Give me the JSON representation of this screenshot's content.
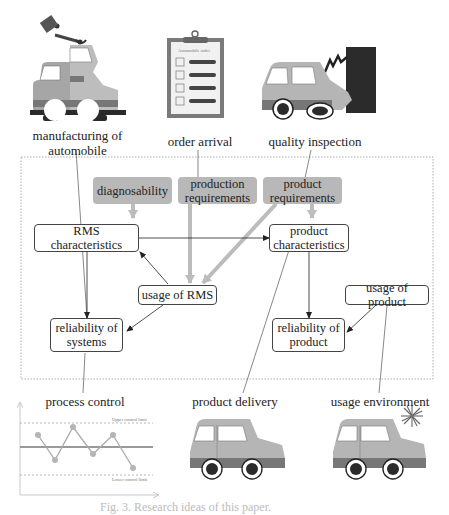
{
  "top_labels": {
    "manufacturing_line1": "manufacturing of",
    "manufacturing_line2": "automobile",
    "order_arrival": "order arrival",
    "quality_inspection": "quality inspection"
  },
  "clipboard_title": "Automobile order",
  "requirement_boxes": {
    "diagnosability": "diagnosability",
    "production_req_line1": "production",
    "production_req_line2": "requirements",
    "product_req_line1": "product",
    "product_req_line2": "requirements"
  },
  "nodes": {
    "rms_char_line1": "RMS",
    "rms_char_line2": "characteristics",
    "product_char_line1": "product",
    "product_char_line2": "characteristics",
    "usage_rms": "usage of RMS",
    "usage_product": "usage of product",
    "rel_systems_line1": "reliability of",
    "rel_systems_line2": "systems",
    "rel_product_line1": "reliability of",
    "rel_product_line2": "product"
  },
  "bottom_labels": {
    "process_control": "process control",
    "product_delivery": "product delivery",
    "usage_environment": "usage environment"
  },
  "control_chart": {
    "upper_limit_label": "Upper control limit",
    "lower_limit_label": "Lower control limit"
  },
  "caption": "Fig. 3. Research ideas of this paper."
}
